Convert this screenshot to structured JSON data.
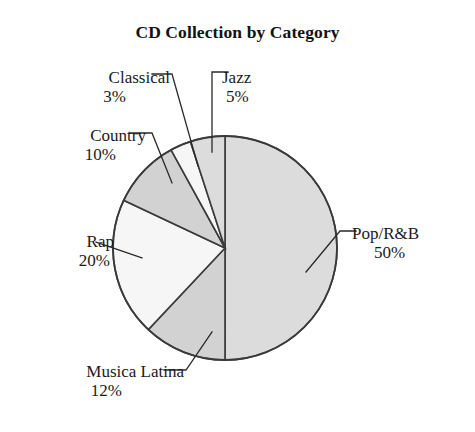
{
  "chart_data": {
    "type": "pie",
    "title": "CD Collection by Category",
    "xlabel": "",
    "ylabel": "",
    "grid": false,
    "legend": "none",
    "label_format": "name + percent, outside with leader lines",
    "start_angle_deg": 0,
    "direction": "clockwise",
    "categories": [
      "Pop/R&B",
      "Musica Latina",
      "Rap",
      "Country",
      "Classical",
      "Jazz"
    ],
    "values": [
      50,
      12,
      20,
      10,
      3,
      5
    ],
    "unit": "%",
    "slices": [
      {
        "label": "Pop/R&B",
        "percent": 50,
        "percent_text": "50%",
        "color": "#dcdcdc"
      },
      {
        "label": "Musica Latina",
        "percent": 12,
        "percent_text": "12%",
        "color": "#d2d2d2"
      },
      {
        "label": "Rap",
        "percent": 20,
        "percent_text": "20%",
        "color": "#f6f6f6"
      },
      {
        "label": "Country",
        "percent": 10,
        "percent_text": "10%",
        "color": "#d2d2d2"
      },
      {
        "label": "Classical",
        "percent": 3,
        "percent_text": "3%",
        "color": "#f6f6f6"
      },
      {
        "label": "Jazz",
        "percent": 5,
        "percent_text": "5%",
        "color": "#dcdcdc"
      }
    ]
  },
  "chart": {
    "title": "CD Collection by Category",
    "outline_color": "#3a3a3a",
    "background": "#ffffff"
  },
  "labels": {
    "classical": {
      "name": "Classical",
      "percent": "3%"
    },
    "jazz": {
      "name": "Jazz",
      "percent": "5%"
    },
    "country": {
      "name": "Country",
      "percent": "10%"
    },
    "rap": {
      "name": "Rap",
      "percent": "20%"
    },
    "musica": {
      "name": "Musica Latina",
      "percent": "12%"
    },
    "pop": {
      "name": "Pop/R&B",
      "percent": "50%"
    }
  }
}
